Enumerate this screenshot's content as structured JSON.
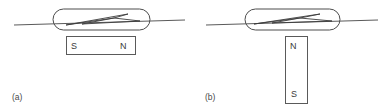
{
  "figure": {
    "background_color": "#ffffff",
    "line_color": "#5a5a5a",
    "text_color": "#3a3a3a",
    "width": 391,
    "height": 112
  },
  "panels": [
    {
      "id": "a",
      "label": "(a)",
      "compass": {
        "name": "compass-capsule",
        "orientation": "horizontal",
        "needle_tilt": "slightly tilted, pointing up-right"
      },
      "magnet": {
        "name": "bar-magnet-horizontal",
        "orientation": "horizontal",
        "left_pole": "S",
        "right_pole": "N"
      },
      "field_line": {
        "name": "horizontal-field-line",
        "orientation": "horizontal"
      }
    },
    {
      "id": "b",
      "label": "(b)",
      "compass": {
        "name": "compass-capsule",
        "orientation": "horizontal",
        "needle_tilt": "slightly tilted, pointing up-right"
      },
      "magnet": {
        "name": "bar-magnet-vertical",
        "orientation": "vertical",
        "top_pole": "N",
        "bottom_pole": "S"
      },
      "field_line": {
        "name": "horizontal-field-line",
        "orientation": "horizontal"
      }
    }
  ]
}
